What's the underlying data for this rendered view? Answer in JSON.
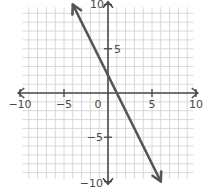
{
  "chart_data": {
    "type": "line",
    "title": "",
    "xlabel": "",
    "ylabel": "",
    "xlim": [
      -10,
      10
    ],
    "ylim": [
      -10,
      10
    ],
    "grid": true,
    "grid_step": 1,
    "x_ticks": [
      -10,
      -5,
      0,
      5,
      10
    ],
    "y_ticks": [
      -10,
      -5,
      5,
      10
    ],
    "tick_labels": {
      "x": [
        "−10",
        "−5",
        "0",
        "5",
        "10"
      ],
      "y": [
        "−10",
        "−5",
        "5",
        "10"
      ]
    },
    "series": [
      {
        "name": "line",
        "equation": "y = -2x + 2",
        "slope": -2,
        "intercept": 2,
        "x": [
          -4,
          6
        ],
        "y": [
          10,
          -10
        ],
        "arrows": "both"
      }
    ],
    "colors": {
      "grid": "#d8d8d8",
      "axis": "#4a4a4a",
      "line": "#555555",
      "text": "#4a4a4a"
    }
  }
}
